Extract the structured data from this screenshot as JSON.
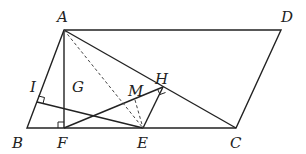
{
  "figure": {
    "type": "geometry-diagram",
    "shape": "parallelogram ABCD",
    "points": {
      "A": {
        "label": "A",
        "x": 64,
        "y": 30
      },
      "B": {
        "label": "B",
        "x": 27,
        "y": 128
      },
      "C": {
        "label": "C",
        "x": 236,
        "y": 128
      },
      "D": {
        "label": "D",
        "x": 281,
        "y": 30
      },
      "E": {
        "label": "E",
        "x": 143,
        "y": 128
      },
      "F": {
        "label": "F",
        "x": 64,
        "y": 128
      },
      "G": {
        "label": "G",
        "x": 64,
        "y": 112
      },
      "H": {
        "label": "H",
        "x": 163,
        "y": 87
      },
      "I": {
        "label": "I",
        "x": 37,
        "y": 102
      },
      "M": {
        "label": "M",
        "x": 153,
        "y": 107
      }
    },
    "segments": [
      "AB",
      "BC",
      "CD",
      "DA",
      "AF",
      "AC",
      "IE",
      "FH",
      "EH"
    ],
    "dashed_segments": [
      "AE",
      "ME"
    ],
    "right_angles": [
      "F",
      "I",
      "H"
    ]
  }
}
